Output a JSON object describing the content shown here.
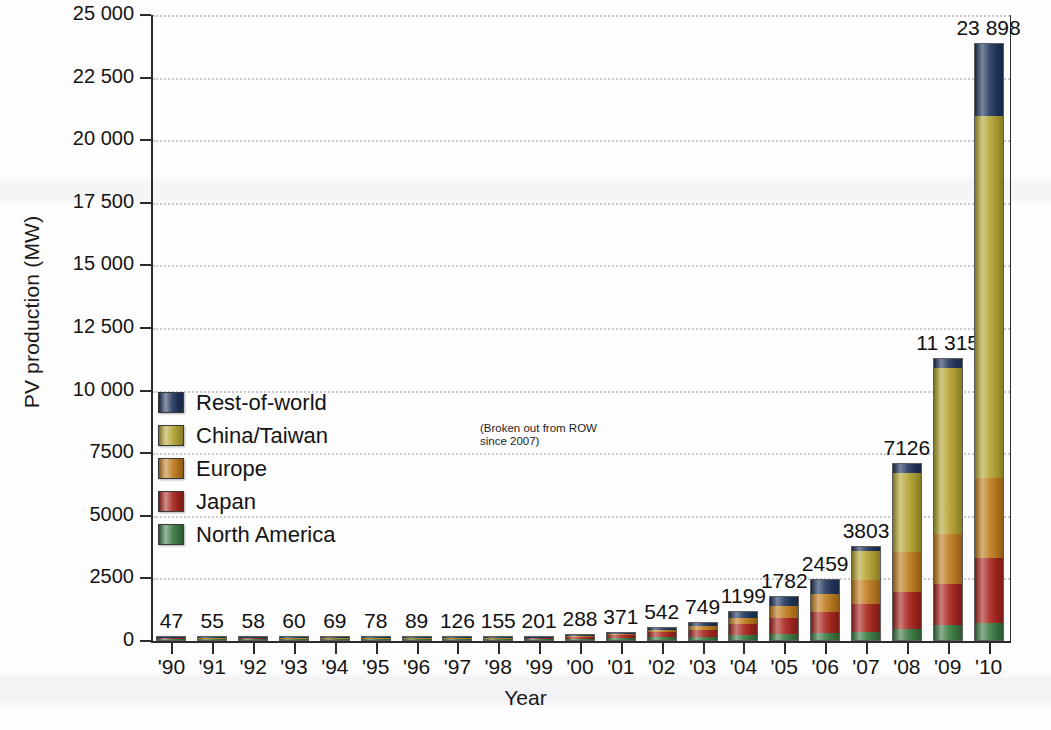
{
  "chart_data": {
    "type": "bar",
    "title": "",
    "xlabel": "Year",
    "ylabel": "PV production (MW)",
    "ylim": [
      0,
      25000
    ],
    "grid": true,
    "stacked": true,
    "legend_position": "inside-left",
    "categories": [
      "'90",
      "'91",
      "'92",
      "'93",
      "'94",
      "'95",
      "'96",
      "'97",
      "'98",
      "'99",
      "'00",
      "'01",
      "'02",
      "'03",
      "'04",
      "'05",
      "'06",
      "'07",
      "'08",
      "'09",
      "'10"
    ],
    "ytick_labels": [
      "0",
      "2500",
      "5000",
      "7500",
      "10 000",
      "12 500",
      "15 000",
      "17 500",
      "20 000",
      "22 500",
      "25 000"
    ],
    "ytick_values": [
      0,
      2500,
      5000,
      7500,
      10000,
      12500,
      15000,
      17500,
      20000,
      22500,
      25000
    ],
    "totals": [
      47,
      55,
      58,
      60,
      69,
      78,
      89,
      126,
      155,
      201,
      288,
      371,
      542,
      749,
      1199,
      1782,
      2459,
      3803,
      7126,
      11315,
      23898
    ],
    "total_labels": [
      "47",
      "55",
      "58",
      "60",
      "69",
      "78",
      "89",
      "126",
      "155",
      "201",
      "288",
      "371",
      "542",
      "749",
      "1199",
      "1782",
      "2459",
      "3803",
      "7126",
      "11 315",
      "23 898"
    ],
    "series": [
      {
        "name": "North America",
        "color": "#3d7a44",
        "values": [
          14,
          16,
          17,
          17,
          20,
          22,
          25,
          35,
          43,
          56,
          75,
          96,
          121,
          144,
          196,
          240,
          280,
          330,
          460,
          610,
          700
        ]
      },
      {
        "name": "Japan",
        "color": "#a8261f",
        "values": [
          17,
          20,
          21,
          22,
          25,
          28,
          32,
          46,
          57,
          74,
          112,
          145,
          235,
          325,
          490,
          700,
          870,
          1130,
          1500,
          1650,
          2600
        ]
      },
      {
        "name": "Europe",
        "color": "#c07d20",
        "values": [
          9,
          10,
          11,
          11,
          13,
          15,
          17,
          24,
          30,
          39,
          57,
          73,
          107,
          150,
          265,
          470,
          740,
          980,
          1600,
          1990,
          3200
        ]
      },
      {
        "name": "China/Taiwan",
        "color": "#b5a533",
        "values": [
          0,
          0,
          0,
          0,
          0,
          0,
          0,
          0,
          0,
          0,
          0,
          0,
          0,
          0,
          0,
          0,
          0,
          1180,
          3200,
          6700,
          14500
        ]
      },
      {
        "name": "Rest-of-world",
        "color": "#21355e",
        "values": [
          7,
          9,
          9,
          10,
          11,
          13,
          15,
          21,
          25,
          32,
          44,
          57,
          79,
          130,
          248,
          372,
          569,
          183,
          366,
          365,
          2898
        ]
      }
    ],
    "legend_note": "(Broken out from ROW since 2007)"
  }
}
